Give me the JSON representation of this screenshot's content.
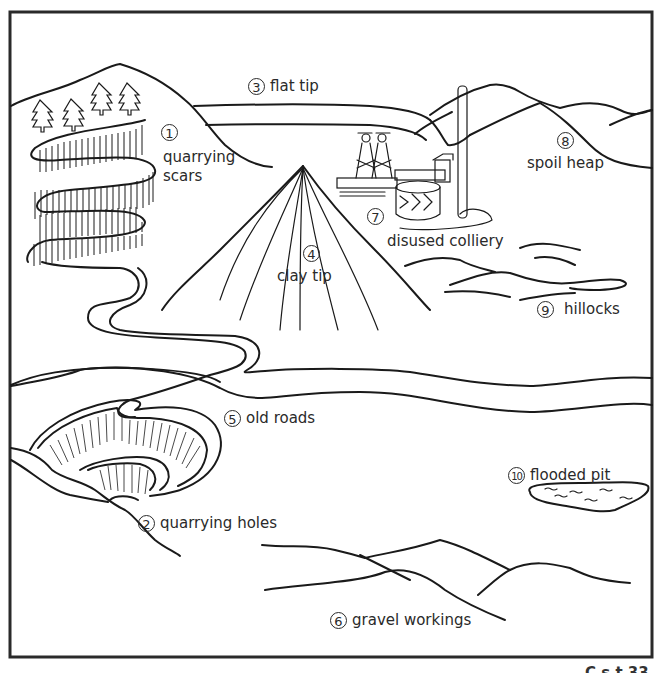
{
  "labels": [
    {
      "number": "1",
      "text": "quarrying scars"
    },
    {
      "number": "2",
      "text": "quarrying holes"
    },
    {
      "number": "3",
      "text": "flat tip"
    },
    {
      "number": "4",
      "text": "clay tip"
    },
    {
      "number": "5",
      "text": "old roads"
    },
    {
      "number": "6",
      "text": "gravel workings"
    },
    {
      "number": "7",
      "text": "disused colliery"
    },
    {
      "number": "8",
      "text": "spoil heap"
    },
    {
      "number": "9",
      "text": "hillocks"
    },
    {
      "number": "10",
      "text": "flooded pit"
    }
  ],
  "label_1_line1": "quarrying",
  "label_1_line2": "scars",
  "label_4_line1": "clay tip",
  "footer": "C      s     t  33",
  "colors": {
    "ink": "#1a1a1a",
    "background": "#ffffff"
  }
}
